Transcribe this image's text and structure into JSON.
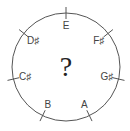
{
  "diagram": {
    "center_symbol": "?",
    "circle": {
      "cx": 66,
      "cy": 67,
      "r": 54,
      "stroke": "#555555"
    },
    "notes": [
      {
        "label": "E",
        "angle": -90
      },
      {
        "label": "F♯",
        "angle": -38.6
      },
      {
        "label": "G♯",
        "angle": 12.9
      },
      {
        "label": "A",
        "angle": 64.3
      },
      {
        "label": "B",
        "angle": 115.7
      },
      {
        "label": "C♯",
        "angle": 167.1
      },
      {
        "label": "D♯",
        "angle": 218.6
      }
    ]
  }
}
